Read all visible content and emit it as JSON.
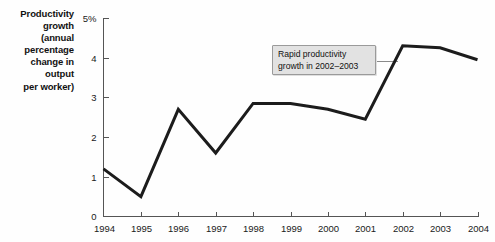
{
  "chart_data": {
    "type": "line",
    "title": "",
    "xlabel": "",
    "ylabel": "Productivity growth (annual percentage change in output per worker)",
    "categories": [
      "1994",
      "1995",
      "1996",
      "1997",
      "1998",
      "1999",
      "2000",
      "2001",
      "2002",
      "2003",
      "2004"
    ],
    "x": [
      1994,
      1995,
      1996,
      1997,
      1998,
      1999,
      2000,
      2001,
      2002,
      2003,
      2004
    ],
    "values": [
      1.2,
      0.5,
      2.7,
      1.6,
      2.85,
      2.85,
      2.7,
      2.45,
      4.3,
      4.25,
      3.95
    ],
    "series": [
      {
        "name": "Productivity growth",
        "values": [
          1.2,
          0.5,
          2.7,
          1.6,
          2.85,
          2.85,
          2.7,
          2.45,
          4.3,
          4.25,
          3.95
        ]
      }
    ],
    "ylim": [
      0,
      5
    ],
    "xlim": [
      1994,
      2004
    ],
    "ytick_values": [
      0,
      1,
      2,
      3,
      4,
      5
    ],
    "ytick_labels": [
      "0",
      "1",
      "2",
      "3",
      "4",
      "5%"
    ],
    "xtick_labels": [
      "1994",
      "1995",
      "1996",
      "1997",
      "1998",
      "1999",
      "2000",
      "2001",
      "2002",
      "2003",
      "2004"
    ],
    "grid": false,
    "legend": "none",
    "line_color": "#1c1c1c",
    "annotations": [
      {
        "text": "Rapid productivity growth in 2002–2003",
        "lines": [
          "Rapid productivity",
          "growth in 2002–2003"
        ],
        "points_to_year": 2002
      }
    ]
  },
  "axis_caption": {
    "lines": [
      "Productivity",
      "growth",
      "(annual",
      "percentage",
      "change in",
      "output",
      "per worker)"
    ]
  },
  "y_ticks": [
    {
      "label": "5%",
      "value": 5
    },
    {
      "label": "4",
      "value": 4
    },
    {
      "label": "3",
      "value": 3
    },
    {
      "label": "2",
      "value": 2
    },
    {
      "label": "1",
      "value": 1
    },
    {
      "label": "0",
      "value": 0
    }
  ],
  "x_ticks": [
    {
      "label": "1994"
    },
    {
      "label": "1995"
    },
    {
      "label": "1996"
    },
    {
      "label": "1997"
    },
    {
      "label": "1998"
    },
    {
      "label": "1999"
    },
    {
      "label": "2000"
    },
    {
      "label": "2001"
    },
    {
      "label": "2002"
    },
    {
      "label": "2003"
    },
    {
      "label": "2004"
    }
  ],
  "annotation": {
    "line1": "Rapid productivity",
    "line2": "growth in 2002–2003"
  },
  "colors": {
    "background": "#fefefe",
    "line": "#1c1c1c",
    "axis": "#555555",
    "annotation_fill": "#e2e2e2",
    "annotation_border": "#9a9a9a",
    "text": "#1a1a1a"
  }
}
